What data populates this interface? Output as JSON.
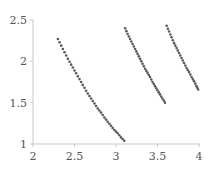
{
  "chart_data": {
    "type": "scatter",
    "title": "",
    "xlabel": "",
    "ylabel": "",
    "xlim": [
      2,
      4
    ],
    "ylim": [
      1,
      2.5
    ],
    "grid": false,
    "legend": null,
    "x_ticks": [
      "2",
      "2.5",
      "3",
      "3.5",
      "4"
    ],
    "y_ticks": [
      "1",
      "1.5",
      "2",
      "2.5"
    ],
    "x_tick_values": [
      2,
      2.5,
      3,
      3.5,
      4
    ],
    "y_tick_values": [
      1,
      1.5,
      2,
      2.5
    ],
    "marker_color": "#5a5a5a",
    "series": [
      {
        "name": "series-1",
        "points": [
          [
            2.3,
            2.27
          ],
          [
            2.34,
            2.19
          ],
          [
            2.38,
            2.11
          ],
          [
            2.42,
            2.03
          ],
          [
            2.46,
            1.96
          ],
          [
            2.5,
            1.89
          ],
          [
            2.54,
            1.82
          ],
          [
            2.58,
            1.75
          ],
          [
            2.62,
            1.68
          ],
          [
            2.66,
            1.61
          ],
          [
            2.7,
            1.55
          ],
          [
            2.74,
            1.49
          ],
          [
            2.78,
            1.43
          ],
          [
            2.82,
            1.38
          ],
          [
            2.86,
            1.32
          ],
          [
            2.9,
            1.27
          ],
          [
            2.94,
            1.22
          ],
          [
            2.98,
            1.17
          ],
          [
            3.02,
            1.13
          ],
          [
            3.06,
            1.08
          ],
          [
            3.1,
            1.04
          ]
        ]
      },
      {
        "name": "series-2",
        "points": [
          [
            3.11,
            2.4
          ],
          [
            3.14,
            2.33
          ],
          [
            3.17,
            2.27
          ],
          [
            3.2,
            2.21
          ],
          [
            3.23,
            2.15
          ],
          [
            3.26,
            2.09
          ],
          [
            3.29,
            2.03
          ],
          [
            3.32,
            1.97
          ],
          [
            3.35,
            1.91
          ],
          [
            3.38,
            1.86
          ],
          [
            3.41,
            1.81
          ],
          [
            3.44,
            1.75
          ],
          [
            3.47,
            1.7
          ],
          [
            3.5,
            1.65
          ],
          [
            3.53,
            1.6
          ],
          [
            3.56,
            1.55
          ],
          [
            3.59,
            1.5
          ]
        ]
      },
      {
        "name": "series-3",
        "points": [
          [
            3.61,
            2.43
          ],
          [
            3.64,
            2.36
          ],
          [
            3.67,
            2.29
          ],
          [
            3.7,
            2.22
          ],
          [
            3.73,
            2.16
          ],
          [
            3.76,
            2.1
          ],
          [
            3.79,
            2.04
          ],
          [
            3.82,
            1.98
          ],
          [
            3.85,
            1.92
          ],
          [
            3.88,
            1.87
          ],
          [
            3.91,
            1.81
          ],
          [
            3.94,
            1.76
          ],
          [
            3.97,
            1.7
          ],
          [
            3.99,
            1.66
          ]
        ]
      }
    ]
  }
}
